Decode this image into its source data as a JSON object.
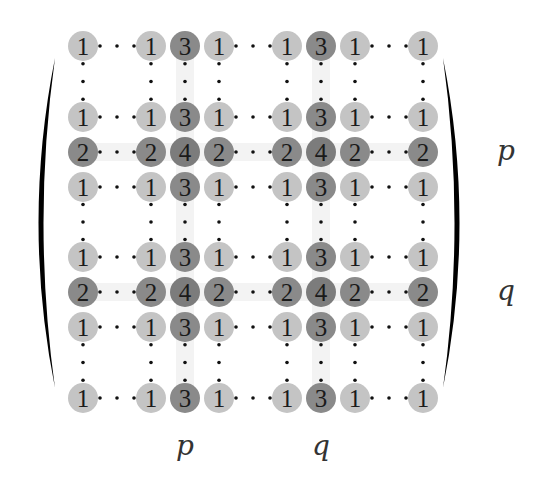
{
  "diagram": {
    "colors": {
      "light_cell": "#c4c4c4",
      "dark_cell": "#8a8a8a",
      "darker_cell": "#7c7c7c",
      "highlight_band": "#f3f3f3",
      "dots": "#111111",
      "bracket": "#000000",
      "text": "#1a1a1a",
      "label": "#333333"
    },
    "columns_x": [
      83,
      151,
      185,
      219,
      287,
      321,
      355,
      423
    ],
    "rows_y": [
      46,
      117,
      152,
      187,
      257,
      292,
      327,
      398
    ],
    "cell_radius": 15,
    "matrix": [
      [
        1,
        1,
        3,
        1,
        1,
        3,
        1,
        1
      ],
      [
        1,
        1,
        3,
        1,
        1,
        3,
        1,
        1
      ],
      [
        2,
        2,
        4,
        2,
        2,
        4,
        2,
        2
      ],
      [
        1,
        1,
        3,
        1,
        1,
        3,
        1,
        1
      ],
      [
        1,
        1,
        3,
        1,
        1,
        3,
        1,
        1
      ],
      [
        2,
        2,
        4,
        2,
        2,
        4,
        2,
        2
      ],
      [
        1,
        1,
        3,
        1,
        1,
        3,
        1,
        1
      ],
      [
        1,
        1,
        3,
        1,
        1,
        3,
        1,
        1
      ]
    ],
    "horizontal_ellipsis_after_columns": [
      0,
      3,
      6
    ],
    "vertical_ellipsis_after_rows": [
      0,
      3,
      6
    ],
    "highlight_columns": [
      2,
      5
    ],
    "highlight_rows": [
      2,
      5
    ],
    "row_labels": [
      {
        "text": "p",
        "row_index": 2,
        "x": 506
      },
      {
        "text": "q",
        "row_index": 5,
        "x": 506
      }
    ],
    "column_labels": [
      {
        "text": "p",
        "col_index": 2,
        "y": 455
      },
      {
        "text": "q",
        "col_index": 5,
        "y": 455
      }
    ],
    "brackets": {
      "left": {
        "top_y": 58,
        "bottom_y": 388,
        "outer_x": 28,
        "inner_x": 55
      },
      "right": {
        "top_y": 58,
        "bottom_y": 388,
        "outer_x": 470,
        "inner_x": 443
      }
    }
  }
}
